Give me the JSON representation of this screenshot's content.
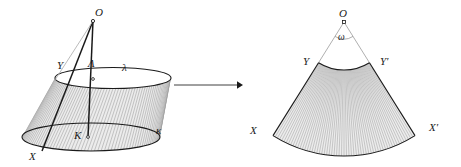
{
  "figure": {
    "background_color": "#ffffff",
    "stroke_color": "#1a1a1a",
    "ruling_color": "#9a9a9a",
    "fill_color": "#e8e8e8",
    "width": 461,
    "height": 167
  },
  "left_panel": {
    "name": "cone-frustum",
    "labels": [
      {
        "id": "apex",
        "text": "O",
        "x": 95,
        "y": 16
      },
      {
        "id": "top-center",
        "text": "Λ",
        "x": 88,
        "y": 67
      },
      {
        "id": "top-circle",
        "text": "λ",
        "x": 122,
        "y": 71
      },
      {
        "id": "top-point-y",
        "text": "Y",
        "x": 57,
        "y": 69
      },
      {
        "id": "base-center",
        "text": "K",
        "x": 74,
        "y": 139
      },
      {
        "id": "base-circle",
        "text": "κ",
        "x": 156,
        "y": 134
      },
      {
        "id": "base-point-x",
        "text": "X",
        "x": 29,
        "y": 160
      }
    ],
    "apex_point": {
      "x": 93,
      "y": 21
    },
    "top_center": {
      "x": 93,
      "y": 79
    },
    "base_center": {
      "x": 88,
      "y": 137
    },
    "top_ellipse": {
      "cx": 113,
      "cy": 78,
      "rx": 58,
      "ry": 10.5
    },
    "base_ellipse": {
      "cx": 91,
      "cy": 137,
      "rx": 69,
      "ry": 14
    },
    "slant_line_x": {
      "x1": 93,
      "y1": 21,
      "x2": 42,
      "y2": 151
    },
    "ruling_count": 64
  },
  "arrow": {
    "name": "transform-arrow",
    "x1": 174,
    "y1": 85,
    "x2": 243,
    "y2": 85,
    "head_size": 6
  },
  "right_panel": {
    "name": "circular-sector",
    "labels": [
      {
        "id": "apex",
        "text": "O",
        "x": 339,
        "y": 17
      },
      {
        "id": "angle",
        "text": "ω",
        "x": 338,
        "y": 40
      },
      {
        "id": "inner-left",
        "text": "Y",
        "x": 303,
        "y": 65
      },
      {
        "id": "inner-right",
        "text": "Y′",
        "x": 380,
        "y": 65
      },
      {
        "id": "outer-left",
        "text": "X",
        "x": 250,
        "y": 134
      },
      {
        "id": "outer-right",
        "text": "X′",
        "x": 429,
        "y": 131
      }
    ],
    "apex_point": {
      "x": 344,
      "y": 22
    },
    "inner_radius": 48,
    "outer_radius": 134,
    "angle_start_deg": 58,
    "angle_end_deg": 122,
    "angle_arc_radius": 17,
    "ruling_count": 60
  }
}
